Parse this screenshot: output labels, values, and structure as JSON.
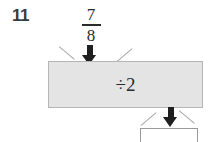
{
  "problem": {
    "number": "11",
    "type": "function-machine"
  },
  "input": {
    "fraction": {
      "numerator": "7",
      "denominator": "8",
      "label": "7/8"
    }
  },
  "machine": {
    "operation": "÷2",
    "fill_color": "#e4e4e4",
    "border_color": "#b5b5b5"
  },
  "output": {
    "value": "",
    "placeholder": "",
    "border_color": "#9a9a9a"
  },
  "icons": {
    "arrow_input": "arrow-down-icon",
    "arrow_output": "arrow-down-icon"
  },
  "colors": {
    "ink": "#2b2b2b",
    "arrow": "#1f1f1f",
    "guide_line": "#a8a8a8",
    "number_ink": "#3a3a3a"
  }
}
